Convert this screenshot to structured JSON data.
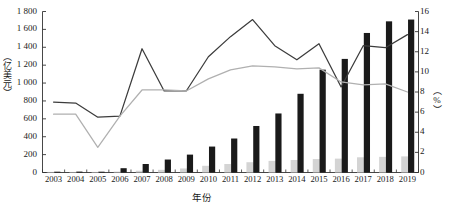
{
  "chart_data": {
    "type": "bar",
    "title": "",
    "xlabel": "年份",
    "ylabel": "（亿美元）",
    "y2label": "（%）",
    "categories": [
      "2003",
      "2004",
      "2005",
      "2006",
      "2007",
      "2008",
      "2009",
      "2010",
      "2011",
      "2012",
      "2013",
      "2014",
      "2015",
      "2016",
      "2017",
      "2018",
      "2019"
    ],
    "ylim": [
      0,
      1800
    ],
    "y2lim": [
      0,
      16
    ],
    "yticks": [
      "0",
      "200",
      "400",
      "600",
      "800",
      "1 000",
      "1 200",
      "1 400",
      "1 600",
      "1 800"
    ],
    "ytick_values": [
      0,
      200,
      400,
      600,
      800,
      1000,
      1200,
      1400,
      1600,
      1800
    ],
    "y2ticks": [
      "0",
      "2",
      "4",
      "6",
      "8",
      "10",
      "12",
      "14",
      "16"
    ],
    "y2tick_values": [
      0,
      2,
      4,
      6,
      8,
      10,
      12,
      14,
      16
    ],
    "grid": false,
    "legend": "none",
    "series": [
      {
        "name": "dark-bar-series",
        "kind": "bar",
        "axis": "left",
        "color": "#1a1a1a",
        "values": [
          8,
          10,
          9,
          48,
          95,
          145,
          200,
          290,
          380,
          520,
          660,
          880,
          1150,
          1270,
          1560,
          1690,
          1710
        ]
      },
      {
        "name": "light-bar-series",
        "kind": "bar",
        "axis": "left",
        "color": "#d4d4d4",
        "values": [
          4,
          5,
          5,
          10,
          20,
          30,
          45,
          75,
          95,
          115,
          130,
          140,
          150,
          155,
          170,
          175,
          180
        ]
      },
      {
        "name": "dark-line-series",
        "kind": "line",
        "axis": "right",
        "color": "#3c3c3c",
        "values": [
          7.0,
          6.9,
          5.5,
          5.6,
          12.3,
          8.1,
          8.1,
          11.5,
          13.5,
          15.2,
          12.6,
          11.2,
          12.8,
          8.5,
          12.6,
          12.4,
          13.7
        ]
      },
      {
        "name": "light-line-series",
        "kind": "line",
        "axis": "right",
        "color": "#b0b0b0",
        "values": [
          5.8,
          5.8,
          2.5,
          5.6,
          8.2,
          8.2,
          8.1,
          9.3,
          10.2,
          10.6,
          10.5,
          10.3,
          10.4,
          9.0,
          8.7,
          8.8,
          8.0
        ]
      }
    ]
  }
}
